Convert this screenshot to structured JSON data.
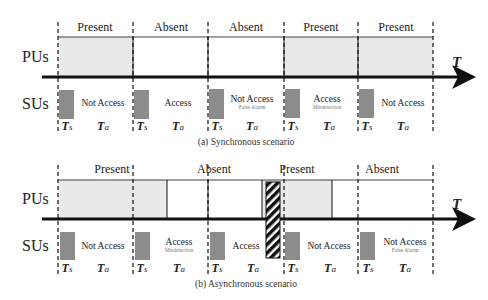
{
  "diagrams": [
    {
      "id": "synchronous",
      "caption": "(a)  Synchronous scenario",
      "row_labels": {
        "pu": "PUs",
        "su": "SUs"
      },
      "axis_label": "T",
      "pu_states": [
        "Present",
        "Absent",
        "Absent",
        "Present",
        "Present"
      ],
      "su_actions": [
        {
          "label": "Not Access",
          "note": ""
        },
        {
          "label": "Access",
          "note": ""
        },
        {
          "label": "Not Access",
          "note": "False Alarm"
        },
        {
          "label": "Access",
          "note": "Misdetection"
        },
        {
          "label": "Not Access",
          "note": ""
        }
      ],
      "sensing_label": "T",
      "sensing_sub": "s",
      "access_label": "T",
      "access_sub": "a"
    },
    {
      "id": "asynchronous",
      "caption": "(b)  Asynchronous scenario",
      "row_labels": {
        "pu": "PUs",
        "su": "SUs"
      },
      "axis_label": "T",
      "pu_states": [
        "Present",
        "Absent",
        "Present",
        "Absent"
      ],
      "su_actions": [
        {
          "label": "Not Access",
          "note": ""
        },
        {
          "label": "Access",
          "note": "Misdetection"
        },
        {
          "label": "Access",
          "note": ""
        },
        {
          "label": "Not Access",
          "note": ""
        },
        {
          "label": "Not Access",
          "note": "False Alarm"
        }
      ],
      "sensing_label": "T",
      "sensing_sub": "s",
      "access_label": "T",
      "access_sub": "a"
    }
  ],
  "colors": {
    "present_fill": "#e9e9e9",
    "sensing_fill": "#8c8c8c",
    "axis": "#111111",
    "collision_hatch": "#111111"
  }
}
